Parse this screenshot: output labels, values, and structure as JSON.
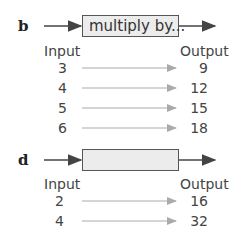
{
  "machines": [
    {
      "label": "b",
      "operation": "multiply by...",
      "input_header": "Input",
      "output_header": "Output",
      "rows": [
        {
          "input": "3",
          "output": "9"
        },
        {
          "input": "4",
          "output": "12"
        },
        {
          "input": "5",
          "output": "15"
        },
        {
          "input": "6",
          "output": "18"
        }
      ]
    },
    {
      "label": "d",
      "operation": "",
      "input_header": "Input",
      "output_header": "Output",
      "rows": [
        {
          "input": "2",
          "output": "16"
        },
        {
          "input": "4",
          "output": "32"
        }
      ]
    }
  ],
  "colors": {
    "arrow_main": "#444444",
    "arrow_row": "#aaaaaa",
    "box_fill": "#ececec"
  }
}
